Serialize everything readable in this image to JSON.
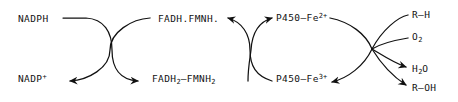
{
  "diagram": {
    "stroke_color": "#111111",
    "background_color": "#ffffff",
    "labels": {
      "nadph": "NADPH",
      "nadp_plus_base": "NADP",
      "nadp_plus_charge": "+",
      "flavin_oxidized": "FADH.FMNH.",
      "flavin_reduced_part1": "FADH",
      "flavin_reduced_sub1": "2",
      "flavin_reduced_part2": "–FMNH",
      "flavin_reduced_sub2": "2",
      "p450_ferrous_base": "P450–Fe",
      "p450_ferrous_charge": "2+",
      "p450_ferric_base": "P450–Fe",
      "p450_ferric_charge": "3+",
      "substrate": "R–H",
      "oxygen_base": "O",
      "oxygen_sub": "2",
      "water_part1": "H",
      "water_sub": "2",
      "water_part2": "O",
      "product": "R–OH"
    },
    "nodes": {
      "crossing_left_x": 110,
      "crossing_left_y": 50,
      "crossing_middle_x": 250,
      "crossing_middle_y": 50,
      "fan_right_x": 372,
      "fan_right_y": 49
    }
  }
}
